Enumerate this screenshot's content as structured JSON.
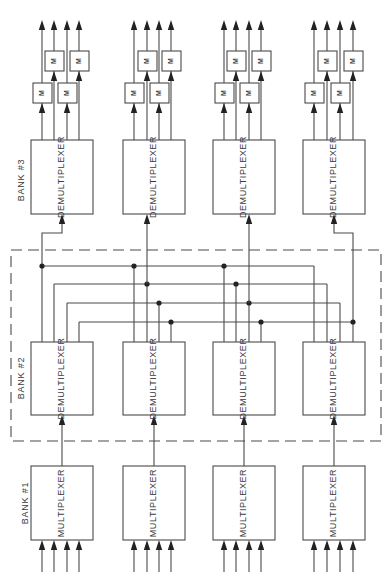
{
  "diagram": {
    "type": "switching-network-block-diagram",
    "orientation": "rotated-90-ccw-text",
    "colors": {
      "line": "#4a4a4a",
      "dot": "#222222",
      "background": "#ffffff"
    },
    "banks": [
      {
        "id": "bank1",
        "label": "BANK #1",
        "block_label": "MULTIPLEXER",
        "label_pos": [
          26,
          503
        ]
      },
      {
        "id": "bank2",
        "label": "BANK #2",
        "block_label": "DEMULTIPLEXER",
        "label_pos": [
          22,
          378
        ]
      },
      {
        "id": "bank3",
        "label": "BANK #3",
        "block_label": "DEMULTIPLEXER",
        "label_pos": [
          22,
          180
        ]
      }
    ],
    "columns": [
      {
        "box_x": 31,
        "box_w": 62,
        "center": 62,
        "lines": [
          42,
          54,
          67,
          79
        ]
      },
      {
        "box_x": 123,
        "box_w": 62,
        "center": 154,
        "lines": [
          134,
          147,
          159,
          171
        ]
      },
      {
        "box_x": 213,
        "box_w": 62,
        "center": 244,
        "lines": [
          224,
          236,
          249,
          261
        ]
      },
      {
        "box_x": 303,
        "box_w": 62,
        "center": 334,
        "lines": [
          314,
          327,
          340,
          353
        ]
      }
    ],
    "rows": {
      "bank3": {
        "y": 140,
        "h": 74
      },
      "bank2": {
        "y": 342,
        "h": 73
      },
      "bank1": {
        "y": 466,
        "h": 74
      }
    },
    "modulator": {
      "label": "M",
      "upper_y": 51,
      "lower_y": 83,
      "h": 20,
      "w": 19
    },
    "buses": [
      266,
      284,
      303,
      322
    ],
    "dashed_region": {
      "x": 11,
      "y": 250,
      "w": 370,
      "h": 191,
      "label": "BANK #2"
    },
    "inputs_per_mux": 4,
    "outputs_per_demux": 4
  }
}
